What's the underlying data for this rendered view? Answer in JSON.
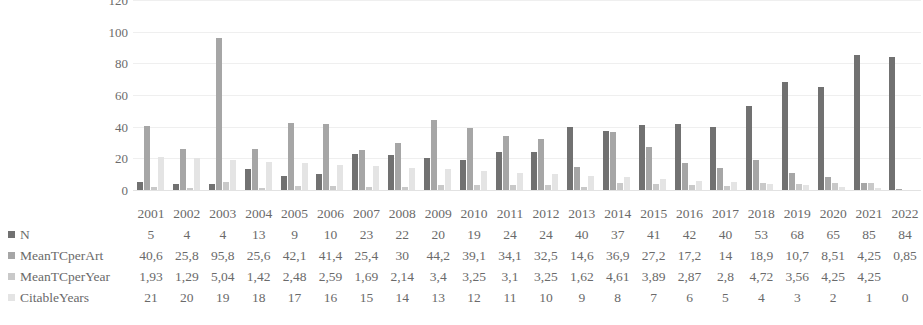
{
  "chart_data": {
    "type": "bar",
    "title": "",
    "xlabel": "",
    "ylabel": "",
    "ylim": [
      0,
      120
    ],
    "yticks": [
      0,
      20,
      40,
      60,
      80,
      100,
      120
    ],
    "grid": true,
    "legend_position": "left-table",
    "categories": [
      "2001",
      "2002",
      "2003",
      "2004",
      "2005",
      "2006",
      "2007",
      "2008",
      "2009",
      "2010",
      "2011",
      "2012",
      "2013",
      "2014",
      "2015",
      "2016",
      "2017",
      "2018",
      "2019",
      "2020",
      "2021",
      "2022"
    ],
    "series": [
      {
        "name": "N",
        "color": "#717171",
        "values": [
          5,
          4,
          4,
          13,
          9,
          10,
          23,
          22,
          20,
          19,
          24,
          24,
          40,
          37,
          41,
          42,
          40,
          53,
          68,
          65,
          85,
          84
        ],
        "labels": [
          "5",
          "4",
          "4",
          "13",
          "9",
          "10",
          "23",
          "22",
          "20",
          "19",
          "24",
          "24",
          "40",
          "37",
          "41",
          "42",
          "40",
          "53",
          "68",
          "65",
          "85",
          "84"
        ]
      },
      {
        "name": "MeanTCperArt",
        "color": "#a6a6a6",
        "values": [
          40.6,
          25.8,
          95.8,
          25.6,
          42.1,
          41.4,
          25.4,
          30,
          44.2,
          39.1,
          34.1,
          32.5,
          14.6,
          36.9,
          27.2,
          17.2,
          14,
          18.9,
          10.7,
          8.51,
          4.25,
          0.85
        ],
        "labels": [
          "40,6",
          "25,8",
          "95,8",
          "25,6",
          "42,1",
          "41,4",
          "25,4",
          "30",
          "44,2",
          "39,1",
          "34,1",
          "32,5",
          "14,6",
          "36,9",
          "27,2",
          "17,2",
          "14",
          "18,9",
          "10,7",
          "8,51",
          "4,25",
          "0,85"
        ]
      },
      {
        "name": "MeanTCperYear",
        "color": "#c9c9c9",
        "values": [
          1.93,
          1.29,
          5.04,
          1.42,
          2.48,
          2.59,
          1.69,
          2.14,
          3.4,
          3.25,
          3.1,
          3.25,
          1.62,
          4.61,
          3.89,
          2.87,
          2.8,
          4.72,
          3.56,
          4.25,
          4.25,
          null
        ],
        "labels": [
          "1,93",
          "1,29",
          "5,04",
          "1,42",
          "2,48",
          "2,59",
          "1,69",
          "2,14",
          "3,4",
          "3,25",
          "3,1",
          "3,25",
          "1,62",
          "4,61",
          "3,89",
          "2,87",
          "2,8",
          "4,72",
          "3,56",
          "4,25",
          "4,25",
          ""
        ]
      },
      {
        "name": "CitableYears",
        "color": "#e4e4e4",
        "values": [
          21,
          20,
          19,
          18,
          17,
          16,
          15,
          14,
          13,
          12,
          11,
          10,
          9,
          8,
          7,
          6,
          5,
          4,
          3,
          2,
          1,
          0
        ],
        "labels": [
          "21",
          "20",
          "19",
          "18",
          "17",
          "16",
          "15",
          "14",
          "13",
          "12",
          "11",
          "10",
          "9",
          "8",
          "7",
          "6",
          "5",
          "4",
          "3",
          "2",
          "1",
          "0"
        ]
      }
    ]
  }
}
